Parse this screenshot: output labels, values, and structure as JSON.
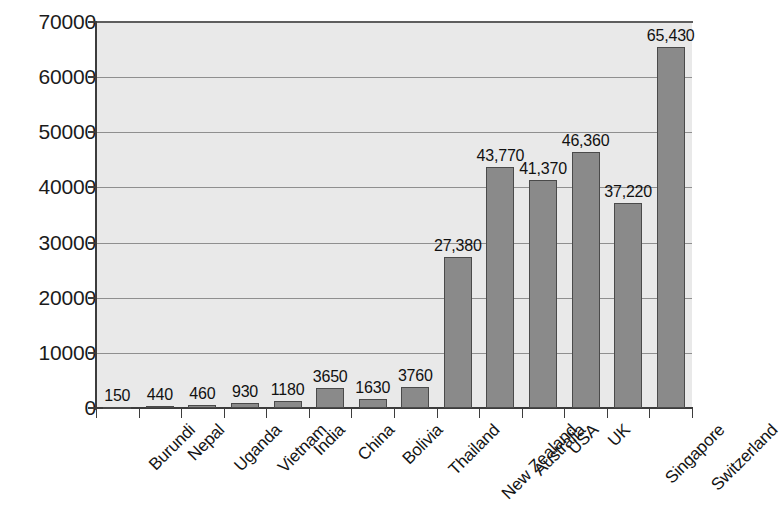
{
  "chart_data": {
    "type": "bar",
    "title": "",
    "subtitle": "",
    "xlabel": "",
    "ylabel": "",
    "ylim": [
      0,
      70000
    ],
    "ytick_step": 10000,
    "yticks": [
      "0",
      "10000",
      "20000",
      "30000",
      "40000",
      "50000",
      "60000",
      "70000"
    ],
    "ytick_values": [
      0,
      10000,
      20000,
      30000,
      40000,
      50000,
      60000,
      70000
    ],
    "grid": true,
    "legend": false,
    "legend_position": "none",
    "categories": [
      "Burundi",
      "Nepal",
      "Uganda",
      "Vietnam",
      "India",
      "China",
      "Bolivia",
      "Thailand",
      "New Zealand",
      "Australia",
      "USA",
      "UK",
      "Singapore",
      "Switzerland"
    ],
    "values": [
      150,
      440,
      460,
      930,
      1180,
      3650,
      1630,
      3760,
      27380,
      43770,
      41370,
      46360,
      37220,
      65430
    ],
    "value_labels": [
      "150",
      "440",
      "460",
      "930",
      "1180",
      "3650",
      "1630",
      "3760",
      "27,380",
      "43,770",
      "41,370",
      "46,360",
      "37,220",
      "65,430"
    ],
    "colors": {
      "bar_fill": "#8a8a8a",
      "bar_border": "#4a4a4a",
      "plot_background": "#e9e9e9",
      "gridline": "#8f8f8f",
      "axis": "#3c3c3c",
      "text": "#141414",
      "page_background": "#ffffff"
    }
  }
}
